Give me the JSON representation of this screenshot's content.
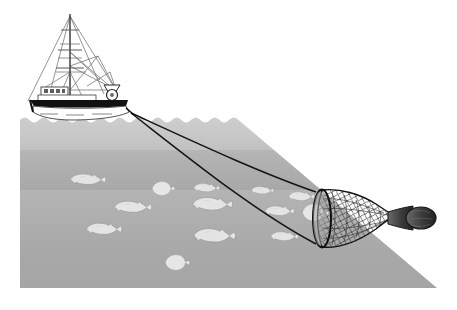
{
  "illustration": {
    "title": "Bottom trawl fishing illustration",
    "subject": "trawler-towing-trawl-net",
    "style": "grayscale line and tone drawing",
    "canvas": {
      "width": 457,
      "height": 310,
      "background": "#ffffff"
    }
  },
  "colors": {
    "page_background": "#ffffff",
    "water_top": "#c9c9c9",
    "water_mid": "#a9a9a9",
    "water_bottom": "#9a9a9a",
    "fish_body": "#e2e2e2",
    "fish_outline": "#8f8f8f",
    "hull_dark": "#111111",
    "hull_white": "#ffffff",
    "rigging": "#6e6e6e",
    "warp_line": "#1a1a1a",
    "net_mesh": "#4a4a4a",
    "net_outline": "#111111",
    "codend_dark": "#2b2b2b"
  },
  "water": {
    "name": "sea-water-body",
    "left": 20,
    "right": 437,
    "surface_y": 116,
    "bottom_y": 288,
    "wave_count": 22,
    "wave_amplitude": 3
  },
  "vessel": {
    "name": "fishing-trawler",
    "hull": {
      "bow_x": 33,
      "stern_x": 130,
      "deck_y": 101,
      "keel_y": 117
    },
    "mast": {
      "x": 70,
      "top_y": 14,
      "base_y": 100,
      "crossbar_count": 3
    },
    "wheelhouse": {
      "x": 42,
      "y": 88,
      "width": 26,
      "height": 10,
      "window_count": 4
    },
    "gallows": {
      "x": 113,
      "y": 88,
      "radius": 6
    },
    "waterline_wake": true
  },
  "trawl": {
    "name": "trawl-gear",
    "warp_lines": [
      {
        "name": "upper-warp",
        "from_x": 131,
        "from_y": 114,
        "to_x": 318,
        "to_y": 195
      },
      {
        "name": "lower-warp",
        "from_x": 131,
        "from_y": 114,
        "to_x": 318,
        "to_y": 243
      }
    ],
    "net": {
      "name": "trawl-net",
      "mouth_x": 322,
      "mouth_top_y": 190,
      "mouth_bottom_y": 247,
      "body_end_x": 383,
      "codend_x": 428,
      "codend_y": 215,
      "mesh_rows": 13,
      "mesh_cols": 11
    }
  },
  "fish": [
    {
      "name": "fish-cod-1",
      "type": "roundfish",
      "x": 85,
      "y": 181,
      "length": 36,
      "facing": "right"
    },
    {
      "name": "fish-flatfish-1",
      "type": "flatfish",
      "x": 160,
      "y": 189,
      "length": 22,
      "facing": "right"
    },
    {
      "name": "fish-cod-2",
      "type": "roundfish",
      "x": 130,
      "y": 208,
      "length": 38,
      "facing": "right"
    },
    {
      "name": "fish-cod-3",
      "type": "roundfish",
      "x": 100,
      "y": 230,
      "length": 34,
      "facing": "right"
    },
    {
      "name": "fish-flatfish-2",
      "type": "flatfish",
      "x": 175,
      "y": 263,
      "length": 24,
      "facing": "right"
    },
    {
      "name": "fish-cod-4",
      "type": "roundfish",
      "x": 205,
      "y": 188,
      "length": 26,
      "facing": "right"
    },
    {
      "name": "fish-cod-5",
      "type": "roundfish",
      "x": 210,
      "y": 204,
      "length": 40,
      "facing": "right"
    },
    {
      "name": "fish-cod-6",
      "type": "roundfish",
      "x": 212,
      "y": 235,
      "length": 42,
      "facing": "right"
    },
    {
      "name": "fish-cod-7",
      "type": "roundfish",
      "x": 261,
      "y": 190,
      "length": 22,
      "facing": "right"
    },
    {
      "name": "fish-cod-8",
      "type": "roundfish",
      "x": 278,
      "y": 211,
      "length": 30,
      "facing": "right"
    },
    {
      "name": "fish-cod-9",
      "type": "roundfish",
      "x": 300,
      "y": 196,
      "length": 26,
      "facing": "right"
    },
    {
      "name": "fish-flatfish-3",
      "type": "flatfish",
      "x": 313,
      "y": 212,
      "length": 26,
      "facing": "right"
    },
    {
      "name": "fish-cod-10",
      "type": "roundfish",
      "x": 283,
      "y": 236,
      "length": 28,
      "facing": "right"
    }
  ],
  "counts": {
    "total_fish": 13,
    "roundfish": 10,
    "flatfish": 3,
    "warp_lines": 2
  }
}
